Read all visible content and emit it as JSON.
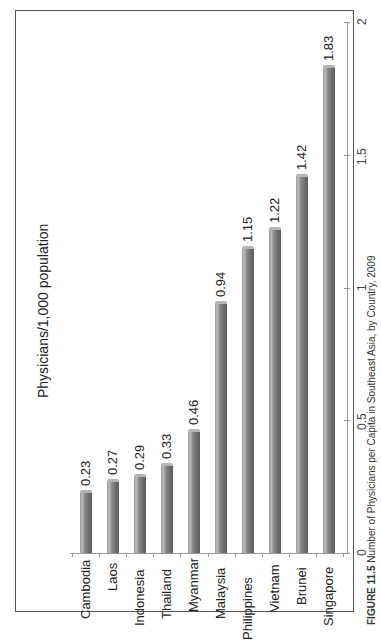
{
  "chart_data": {
    "type": "bar",
    "orientation": "rotated-90",
    "title": "Physicians/1,000 population",
    "categories": [
      "Cambodia",
      "Laos",
      "Indonesia",
      "Thailand",
      "Myanmar",
      "Malaysia",
      "Philippines",
      "Vietnam",
      "Brunei",
      "Singapore"
    ],
    "values": [
      0.23,
      0.27,
      0.29,
      0.33,
      0.46,
      0.94,
      1.15,
      1.22,
      1.42,
      1.83
    ],
    "data_labels": [
      "0.23",
      "0.27",
      "0.29",
      "0.33",
      "0.46",
      "0.94",
      "1.15",
      "1.22",
      "1.42",
      "1.83"
    ],
    "xlabel": "",
    "ylabel": "",
    "ylim": [
      0,
      2
    ],
    "yticks": [
      "0",
      "0.5",
      "1",
      "1.5",
      "2"
    ],
    "grid": false,
    "legend": "none",
    "bar_color": "#7a7a7a"
  },
  "caption": {
    "prefix": "FIGURE 11.5",
    "text": "Number of Physicians per Capita in Southeast Asia, by Country, 2009"
  }
}
